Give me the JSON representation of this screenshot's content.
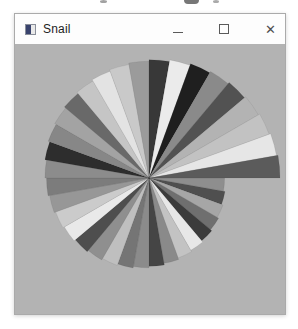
{
  "window": {
    "title": "Snail",
    "controls": {
      "minimize": "–",
      "maximize": "□",
      "close": "✕"
    },
    "client": {
      "bg": "#b3b3b3"
    },
    "canvas": {
      "chart_data": {
        "type": "pie",
        "title": "Snail",
        "description": "Fan of 36 ten-degree gray wedges whose radius grows linearly clockwise from the east axis, leaving a stepped notch at 3 o'clock",
        "center": {
          "x": 134,
          "y": 134
        },
        "start_angle_deg": 0,
        "sweep_deg": 10,
        "radius_start": 74,
        "radius_end": 131,
        "wedge_colors": [
          "#8e8e8e",
          "#4f4f4f",
          "#a6a6a6",
          "#6f6f6f",
          "#3b3b3b",
          "#e7e7e7",
          "#c3c3c3",
          "#8a8a8a",
          "#454545",
          "#8b8b8b",
          "#757575",
          "#bfbfbf",
          "#8f8f8f",
          "#4e4e4e",
          "#e9e9e9",
          "#cbcbcb",
          "#979797",
          "#7c7c7c",
          "#8c8c8c",
          "#2d2d2d",
          "#878787",
          "#a3a3a3",
          "#696969",
          "#c5c5c5",
          "#e3e3e3",
          "#c9c9c9",
          "#9b9b9b",
          "#383838",
          "#ebebeb",
          "#1f1f1f",
          "#8a8a8a",
          "#525252",
          "#b3b3b3",
          "#c2c2c2",
          "#e6e6e6",
          "#5b5b5b"
        ]
      }
    }
  }
}
